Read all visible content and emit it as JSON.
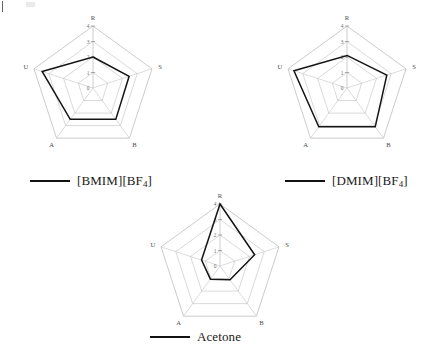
{
  "figure": {
    "background": "#ffffff",
    "grid_color": "#b9b9b9",
    "spoke_color": "#bfbfbf",
    "series_color": "#141414",
    "tick_color": "#6b6b6b",
    "axis_label_color": "#4d4d4d"
  },
  "axes": {
    "labels": [
      "R",
      "S",
      "B",
      "A",
      "U"
    ],
    "tick_labels": [
      "0",
      "1",
      "2",
      "3",
      "4"
    ],
    "rmin": 0,
    "rmax": 4,
    "rings": 5,
    "tick_axis": "R"
  },
  "legends": {
    "bmim": {
      "label_main": "[BMIM][BF",
      "label_sub": "4",
      "label_tail": "]"
    },
    "dmim": {
      "label_main": "[DMIM][BF",
      "label_sub": "4",
      "label_tail": "]"
    },
    "acetone": {
      "label_main": "Acetone",
      "label_sub": "",
      "label_tail": ""
    }
  },
  "chart_data": [
    {
      "type": "radar",
      "title": "[BMIM][BF4]",
      "categories": [
        "R",
        "S",
        "B",
        "A",
        "U"
      ],
      "values": [
        2.0,
        2.45,
        2.5,
        2.5,
        3.45
      ],
      "rlim": [
        0,
        4
      ],
      "ticks": [
        0,
        1,
        2,
        3,
        4
      ],
      "grid": true,
      "legend": "[BMIM][BF4]",
      "legend_position": "below"
    },
    {
      "type": "radar",
      "title": "[DMIM][BF4]",
      "categories": [
        "R",
        "S",
        "B",
        "A",
        "U"
      ],
      "values": [
        2.1,
        2.7,
        3.1,
        3.1,
        3.6
      ],
      "rlim": [
        0,
        4
      ],
      "ticks": [
        0,
        1,
        2,
        3,
        4
      ],
      "grid": true,
      "legend": "[DMIM][BF4]",
      "legend_position": "below"
    },
    {
      "type": "radar",
      "title": "Acetone",
      "categories": [
        "R",
        "S",
        "B",
        "A",
        "U"
      ],
      "values": [
        4.0,
        2.35,
        1.1,
        1.05,
        1.25
      ],
      "rlim": [
        0,
        4
      ],
      "ticks": [
        0,
        1,
        2,
        3,
        4
      ],
      "grid": true,
      "legend": "Acetone",
      "legend_position": "below"
    }
  ]
}
